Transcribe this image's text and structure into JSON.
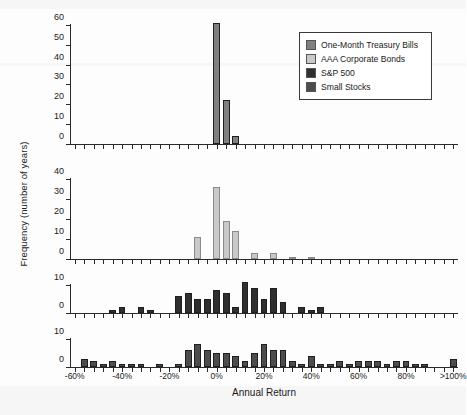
{
  "figure": {
    "xlabel": "Annual Return",
    "ylabel": "Frequency (number of years)"
  },
  "legend": {
    "items": [
      {
        "label": "One-Month Treasury Bills",
        "color": "#808080"
      },
      {
        "label": "AAA Corporate Bonds",
        "color": "#c9c9c9"
      },
      {
        "label": "S&P 500",
        "color": "#2f2f2f"
      },
      {
        "label": "Small Stocks",
        "color": "#4d4d4d"
      }
    ]
  },
  "xaxis": {
    "tick_labels": [
      "-60%",
      "-40%",
      "-20%",
      "0%",
      "20%",
      "40%",
      "60%",
      "80%",
      ">100%"
    ],
    "tick_values": [
      -60,
      -40,
      -20,
      0,
      20,
      40,
      60,
      80,
      100
    ],
    "min": -62,
    "max": 102,
    "bin_width": 4
  },
  "chart_data": [
    {
      "type": "bar",
      "title": "One-Month Treasury Bills",
      "color": "#808080",
      "xlabel": "Annual Return",
      "ylabel": "Frequency (number of years)",
      "ylim": [
        0,
        62
      ],
      "yticks": [
        0,
        10,
        20,
        30,
        40,
        50,
        60
      ],
      "grid": false,
      "bins": [
        -60,
        -56,
        -52,
        -48,
        -44,
        -40,
        -36,
        -32,
        -28,
        -24,
        -20,
        -16,
        -12,
        -8,
        -4,
        0,
        4,
        8,
        12,
        16,
        20,
        24,
        28,
        32,
        36,
        40,
        44,
        48,
        52,
        56,
        60,
        64,
        68,
        72,
        76,
        80,
        84,
        88,
        92,
        96,
        100
      ],
      "values": [
        0,
        0,
        0,
        0,
        0,
        0,
        0,
        0,
        0,
        0,
        0,
        0,
        0,
        0,
        0,
        61,
        22,
        4,
        0,
        0,
        0,
        0,
        0,
        0,
        0,
        0,
        0,
        0,
        0,
        0,
        0,
        0,
        0,
        0,
        0,
        0,
        0,
        0,
        0,
        0,
        0
      ]
    },
    {
      "type": "bar",
      "title": "AAA Corporate Bonds",
      "color": "#c9c9c9",
      "xlabel": "Annual Return",
      "ylabel": "Frequency (number of years)",
      "ylim": [
        0,
        42
      ],
      "yticks": [
        0,
        10,
        20,
        30,
        40
      ],
      "grid": false,
      "bins": [
        -60,
        -56,
        -52,
        -48,
        -44,
        -40,
        -36,
        -32,
        -28,
        -24,
        -20,
        -16,
        -12,
        -8,
        -4,
        0,
        4,
        8,
        12,
        16,
        20,
        24,
        28,
        32,
        36,
        40,
        44,
        48,
        52,
        56,
        60,
        64,
        68,
        72,
        76,
        80,
        84,
        88,
        92,
        96,
        100
      ],
      "values": [
        0,
        0,
        0,
        0,
        0,
        0,
        0,
        0,
        0,
        0,
        0,
        0,
        0,
        11,
        0,
        36,
        19,
        14,
        0,
        3,
        0,
        3,
        0,
        1,
        0,
        1,
        0,
        0,
        0,
        0,
        0,
        0,
        0,
        0,
        0,
        0,
        0,
        0,
        0,
        0,
        0
      ]
    },
    {
      "type": "bar",
      "title": "S&P 500",
      "color": "#2f2f2f",
      "xlabel": "Annual Return",
      "ylabel": "Frequency (number of years)",
      "ylim": [
        0,
        12
      ],
      "yticks": [
        0,
        10
      ],
      "grid": false,
      "bins": [
        -60,
        -56,
        -52,
        -48,
        -44,
        -40,
        -36,
        -32,
        -28,
        -24,
        -20,
        -16,
        -12,
        -8,
        -4,
        0,
        4,
        8,
        12,
        16,
        20,
        24,
        28,
        32,
        36,
        40,
        44,
        48,
        52,
        56,
        60,
        64,
        68,
        72,
        76,
        80,
        84,
        88,
        92,
        96,
        100
      ],
      "values": [
        0,
        0,
        0,
        0,
        1,
        2,
        0,
        2,
        1,
        0,
        0,
        6,
        7,
        5,
        5,
        8,
        7,
        2,
        11,
        9,
        5,
        9,
        4,
        0,
        2,
        1,
        2,
        0,
        0,
        0,
        0,
        0,
        0,
        0,
        0,
        0,
        0,
        0,
        0,
        0,
        0
      ]
    },
    {
      "type": "bar",
      "title": "Small Stocks",
      "color": "#4d4d4d",
      "xlabel": "Annual Return",
      "ylabel": "Frequency (number of years)",
      "ylim": [
        0,
        12
      ],
      "yticks": [
        0,
        10
      ],
      "grid": false,
      "bins": [
        -60,
        -56,
        -52,
        -48,
        -44,
        -40,
        -36,
        -32,
        -28,
        -24,
        -20,
        -16,
        -12,
        -8,
        -4,
        0,
        4,
        8,
        12,
        16,
        20,
        24,
        28,
        32,
        36,
        40,
        44,
        48,
        52,
        56,
        60,
        64,
        68,
        72,
        76,
        80,
        84,
        88,
        92,
        96,
        100
      ],
      "values": [
        0,
        3,
        2,
        1,
        2,
        1,
        1,
        1,
        0,
        1,
        0,
        1,
        6,
        8,
        6,
        5,
        5,
        4,
        2,
        5,
        8,
        6,
        6,
        2,
        1,
        4,
        1,
        1,
        2,
        1,
        2,
        2,
        2,
        1,
        2,
        2,
        1,
        1,
        0,
        0,
        3
      ]
    }
  ]
}
